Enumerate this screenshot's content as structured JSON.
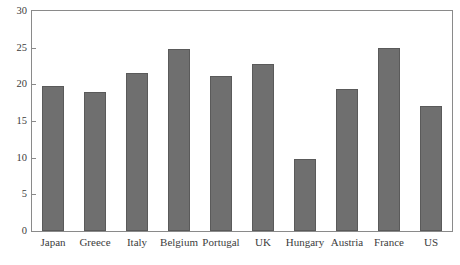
{
  "chart_data": {
    "type": "bar",
    "title": "",
    "xlabel": "",
    "ylabel": "",
    "ylim": [
      0,
      30
    ],
    "yticks": [
      0,
      5,
      10,
      15,
      20,
      25,
      30
    ],
    "ytick_labels": [
      "0",
      "5",
      "10",
      "15",
      "20",
      "25",
      "30"
    ],
    "grid": false,
    "legend": "none",
    "bar_color": "#6f6f6f",
    "bar_edge_color": "#5a5a5a",
    "axis_color": "#8a8a8a",
    "background_color": "#ffffff",
    "categories": [
      "Japan",
      "Greece",
      "Italy",
      "Belgium",
      "Portugal",
      "UK",
      "Hungary",
      "Austria",
      "France",
      "US"
    ],
    "values": [
      19.8,
      19.0,
      21.5,
      24.8,
      21.2,
      22.8,
      9.8,
      19.4,
      25.0,
      17.0
    ]
  },
  "figure": {
    "cut_off_title": ""
  }
}
